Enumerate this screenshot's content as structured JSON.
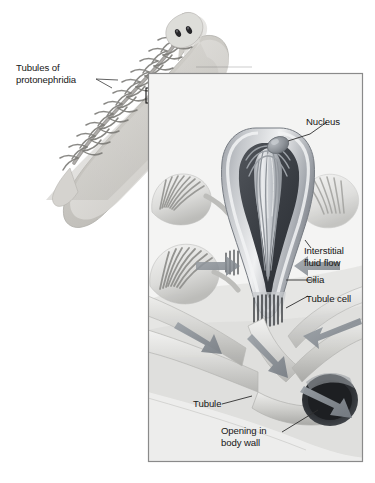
{
  "figure": {
    "name": "protonephridia-flame-cell-diagram",
    "organism": "planarian flatworm",
    "background_color": "#ffffff",
    "frame_color": "#8a8a8a",
    "arrow_color": "#8d9197",
    "leader_color": "#3a3a3a",
    "text_color": "#171717"
  },
  "top_cut_text": "",
  "labels": {
    "tubules_of_protonephridia": "Tubules of\nprotonephridia",
    "nucleus": "Nucleus",
    "interstitial_fluid_flow": "Interstitial\nfluid flow",
    "cilia": "Cilia",
    "tubule_cell": "Tubule cell",
    "tubule": "Tubule",
    "opening_in_body_wall": "Opening in\nbody wall"
  },
  "overview": {
    "name": "planarian-overview",
    "description": "Dorsal view of a planarian flatworm with branching protonephridial tubules, head with two eyespots",
    "body_fill": "#cfcdc9",
    "tubule_color": "#7e7d7a",
    "eyespot_color": "#2b2b2b"
  },
  "callout": {
    "name": "magnification-callout",
    "box_x": 146,
    "box_y": 88,
    "box_w": 15,
    "box_h": 15,
    "box_stroke": "#111111"
  },
  "inset": {
    "name": "flame-cell-detail-inset",
    "x": 148,
    "y": 73,
    "width": 215,
    "height": 389,
    "border_color": "#8a8a8a",
    "description": "Cutaway of a flame cell (protonephridium) showing nucleus, tuft of cilia, tubule cell, tubules and the opening in the body wall"
  },
  "structures": [
    {
      "name": "flame-cell-main",
      "label_ref": "nucleus"
    },
    {
      "name": "flame-cell-left-upper",
      "label_ref": "cilia"
    },
    {
      "name": "flame-cell-left-lower",
      "label_ref": "cilia"
    },
    {
      "name": "tubule-network",
      "label_ref": "tubule"
    },
    {
      "name": "body-wall-opening",
      "label_ref": "opening_in_body_wall"
    }
  ],
  "flow_arrows": [
    {
      "name": "flow-arrow-into-cell-left",
      "direction": "right-down"
    },
    {
      "name": "flow-arrow-into-cell-right",
      "direction": "left-down"
    },
    {
      "name": "flow-arrow-tubule-left",
      "direction": "down-right"
    },
    {
      "name": "flow-arrow-tubule-center",
      "direction": "down-right"
    },
    {
      "name": "flow-arrow-tubule-right",
      "direction": "left"
    },
    {
      "name": "flow-arrow-exit",
      "direction": "right-down"
    },
    {
      "name": "callout-arrow",
      "direction": "curved-down-right"
    }
  ]
}
